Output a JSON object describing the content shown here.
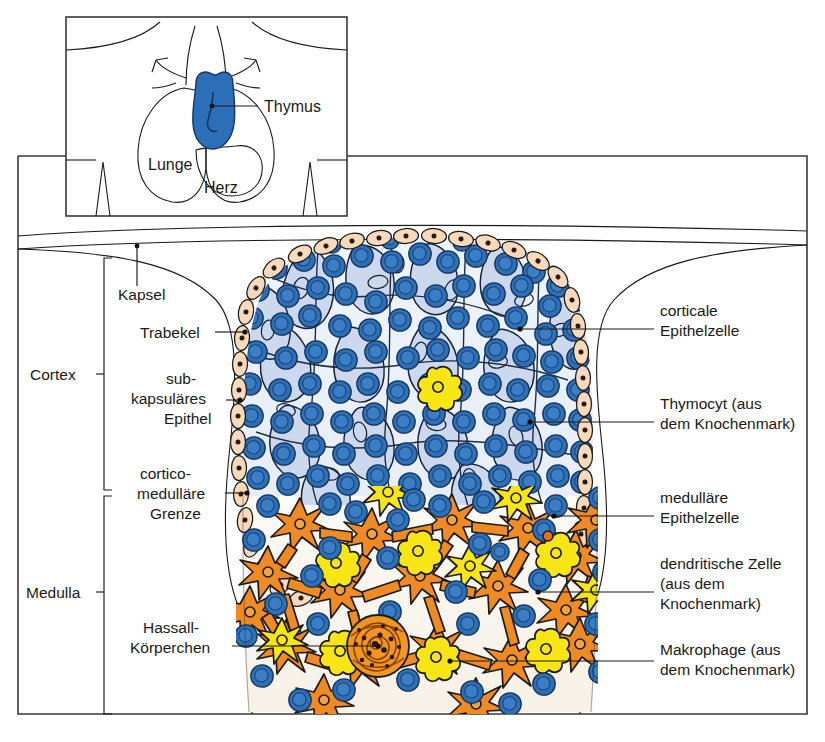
{
  "figure": {
    "language": "de"
  },
  "inset": {
    "name": "thorax-overview",
    "labels": [
      {
        "id": "thymus",
        "text": "Thymus"
      },
      {
        "id": "lunge",
        "text": "Lunge"
      },
      {
        "id": "herz",
        "text": "Herz"
      }
    ]
  },
  "brackets": [
    {
      "id": "cortex",
      "text": "Cortex"
    },
    {
      "id": "medulla",
      "text": "Medulla"
    }
  ],
  "labels_left": [
    {
      "id": "kapsel",
      "lines": [
        "Kapsel"
      ]
    },
    {
      "id": "trabekel",
      "lines": [
        "Trabekel"
      ]
    },
    {
      "id": "subkapsulaeres-epithel",
      "lines": [
        "sub-",
        "kapsuläres",
        "Epithel"
      ]
    },
    {
      "id": "cortico-medullaere-grenze",
      "lines": [
        "cortico-",
        "medulläre",
        "Grenze"
      ]
    },
    {
      "id": "hassall-koerperchen",
      "lines": [
        "Hassall-",
        "Körperchen"
      ]
    }
  ],
  "labels_right": [
    {
      "id": "corticale-epithelzelle",
      "lines": [
        "corticale",
        "Epithelzelle"
      ]
    },
    {
      "id": "thymocyt",
      "lines": [
        "Thymocyt (aus",
        "dem Knochenmark)"
      ]
    },
    {
      "id": "medullaere-epithelzelle",
      "lines": [
        "medulläre",
        "Epithelzelle"
      ]
    },
    {
      "id": "dendritische-zelle",
      "lines": [
        "dendritische Zelle",
        "(aus dem",
        "Knochenmark)"
      ]
    },
    {
      "id": "makrophage",
      "lines": [
        "Makrophage (aus",
        "dem Knochenmark)"
      ]
    }
  ],
  "colors": {
    "thymocyte_blue": "#2f6fb5",
    "thymocyte_blue_dark": "#1d55a0",
    "cortex_epithelium_fill": "#ccd9ee",
    "cortex_bg": "#eef4fb",
    "subcapsular_peach": "#f7d9bb",
    "medullary_orange": "#ef8b22",
    "dendritic_yellow": "#f7e614",
    "hassall_orange": "#f0971f",
    "outline": "#1a1a1a",
    "frame": "#3a3a3a",
    "medulla_bg": "#fbf7ef"
  }
}
